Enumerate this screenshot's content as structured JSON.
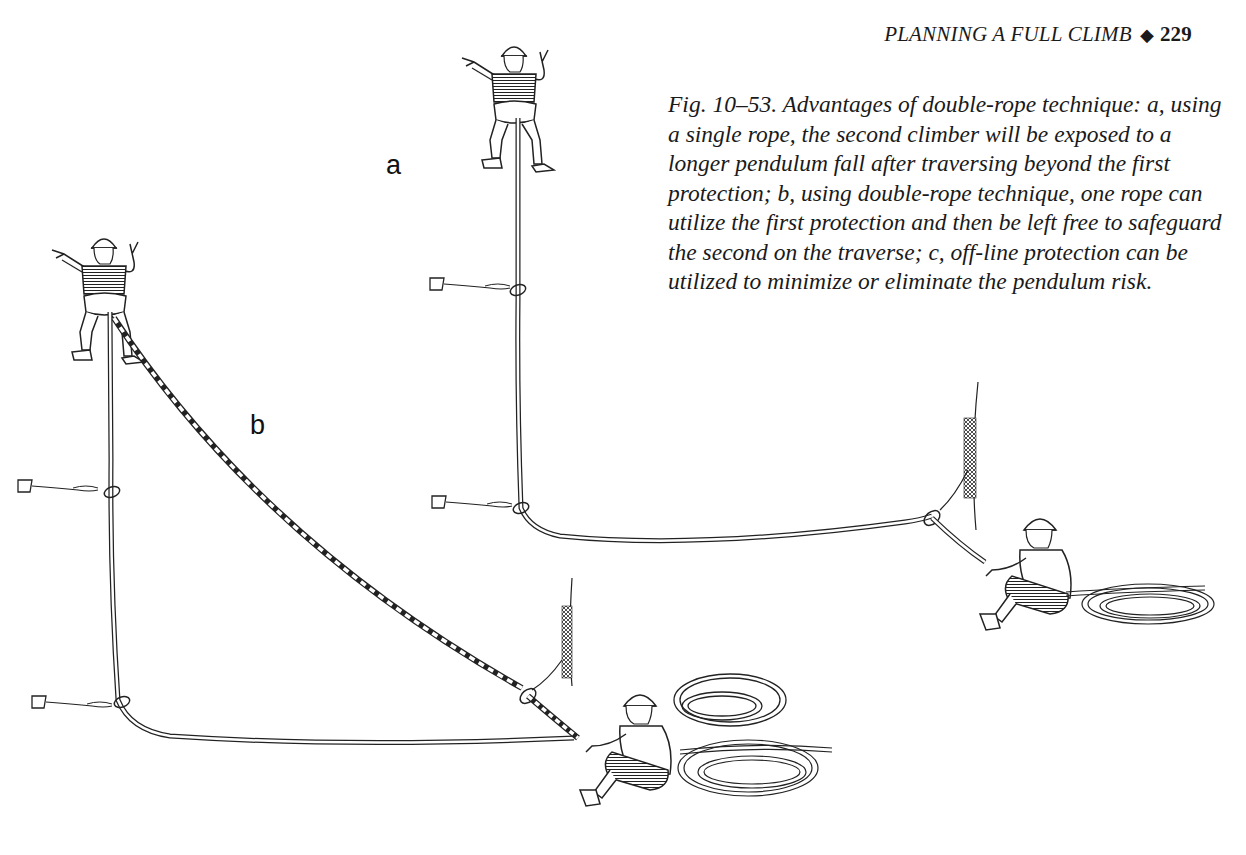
{
  "header": {
    "section_title": "PLANNING A FULL CLIMB",
    "separator_glyph": "◆",
    "page_number": "229"
  },
  "figure": {
    "caption": "Fig. 10–53. Advantages of double-rope technique: a, using a single rope, the second climber will be exposed to a longer pendulum fall after traversing beyond the first protection; b, using double-rope technique, one rope can utilize the first protection and then be left free to safeguard the second on the traverse; c, off-line protection can be utilized to minimize or eliminate the pendulum risk.",
    "panel_labels": {
      "a": "a",
      "b": "b"
    },
    "illustration": {
      "panel_a": "Single rope: leader above, two protection points on vertical line, rope traverses right to off-line anchor near rock face, belayer seated with coiled rope",
      "panel_b": "Double rope: leader above, one rope clipped to two protection points, second striped rope runs diagonally to off-line anchor at rock face, belayer seated with two coiled ropes"
    }
  }
}
